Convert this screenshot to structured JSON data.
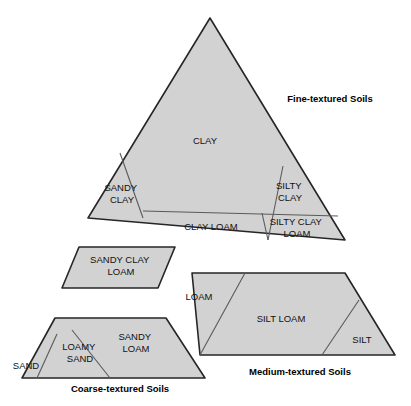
{
  "figure": {
    "background_color": "#ffffff",
    "region_fill_color": "#d2d2d2",
    "region_stroke_color": "#262626",
    "divider_color": "#5a5a5a",
    "text_color": "#111111"
  },
  "groups": [
    {
      "id": "fine",
      "label": "Fine-textured Soils",
      "label_x": 330,
      "label_y": 99,
      "classes": [
        "CLAY",
        "SANDY CLAY",
        "SILTY CLAY",
        "CLAY LOAM",
        "SILTY CLAY LOAM"
      ]
    },
    {
      "id": "medium",
      "label": "Medium-textured Soils",
      "label_x": 300,
      "label_y": 372,
      "classes": [
        "SANDY CLAY LOAM",
        "LOAM",
        "SILT LOAM",
        "SILT"
      ]
    },
    {
      "id": "coarse",
      "label": "Coarse-textured Soils",
      "label_x": 120,
      "label_y": 389,
      "classes": [
        "SAND",
        "LOAMY SAND",
        "SANDY LOAM"
      ]
    }
  ],
  "shapes": {
    "fine_triangle": "210,18 88,218 345,240 345,240",
    "fine_triangle_path": "M210,18 L88,218 L345,240 Z",
    "medium_scl": "M79,247 L175,247 L158,288 L62,288 Z",
    "medium_main": "M192,273 L345,273 L395,355 L200,355 Z",
    "coarse_trapezoid": "M55,318 L166,318 L205,378 L22,378 Z"
  },
  "dividers": {
    "fine_sandy_clay": "M120,153 L143,218",
    "fine_silty_clay": "M283,166 L268,240",
    "fine_clay_loam_top": "M143,211 L338,216",
    "fine_silty_clay_loam": "M262,213 L268,240",
    "medium_loam_silt": "M245,273 L200,355",
    "medium_silt": "M359,300 L322,355",
    "coarse_sand": "M57,334 L37,378",
    "coarse_loamy_sand": "M72,330 L110,378"
  },
  "regions": [
    {
      "id": "clay",
      "label": "CLAY",
      "lines": [
        "CLAY"
      ],
      "x": 205,
      "y": 141,
      "group": "fine"
    },
    {
      "id": "sandy-clay",
      "label": "SANDY CLAY",
      "lines": [
        "SANDY",
        "CLAY"
      ],
      "x": 122,
      "y": 194,
      "group": "fine"
    },
    {
      "id": "silty-clay",
      "label": "SILTY CLAY",
      "lines": [
        "SILTY",
        "CLAY"
      ],
      "x": 290,
      "y": 192,
      "group": "fine"
    },
    {
      "id": "clay-loam",
      "label": "CLAY LOAM",
      "lines": [
        "CLAY LOAM"
      ],
      "x": 211,
      "y": 227,
      "group": "fine"
    },
    {
      "id": "silty-clay-loam",
      "label": "SILTY CLAY LOAM",
      "lines": [
        "SILTY CLAY",
        "LOAM"
      ],
      "x": 297,
      "y": 227,
      "group": "fine"
    },
    {
      "id": "sandy-clay-loam",
      "label": "SANDY CLAY LOAM",
      "lines": [
        "SANDY CLAY",
        "LOAM"
      ],
      "x": 121,
      "y": 266,
      "group": "medium"
    },
    {
      "id": "loam",
      "label": "LOAM",
      "lines": [
        "LOAM"
      ],
      "x": 199,
      "y": 297,
      "group": "medium"
    },
    {
      "id": "silt-loam",
      "label": "SILT LOAM",
      "lines": [
        "SILT LOAM"
      ],
      "x": 281,
      "y": 319,
      "group": "medium"
    },
    {
      "id": "silt",
      "label": "SILT",
      "lines": [
        "SILT"
      ],
      "x": 362,
      "y": 340,
      "group": "medium"
    },
    {
      "id": "sand",
      "label": "SAND",
      "lines": [
        "SAND"
      ],
      "x": 26,
      "y": 366,
      "group": "coarse"
    },
    {
      "id": "loamy-sand",
      "label": "LOAMY SAND",
      "lines": [
        "LOAMY",
        "SAND"
      ],
      "x": 80,
      "y": 352,
      "group": "coarse"
    },
    {
      "id": "sandy-loam",
      "label": "SANDY LOAM",
      "lines": [
        "SANDY",
        "LOAM"
      ],
      "x": 134,
      "y": 343,
      "group": "coarse"
    }
  ]
}
